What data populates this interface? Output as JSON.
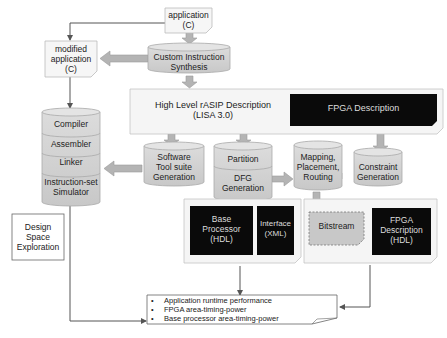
{
  "diagram": {
    "application": [
      "application",
      "(C)"
    ],
    "modified_application": [
      "modified",
      "application",
      "(C)"
    ],
    "custom_instruction_synthesis": [
      "Custom Instruction",
      "Synthesis"
    ],
    "rasip_description": [
      "High Level rASIP Description",
      "(LISA 3.0)"
    ],
    "fpga_description_top": "FPGA Description",
    "tool_stack": [
      "Compiler",
      "Assembler",
      "Linker",
      "Instruction-set",
      "Simulator"
    ],
    "software_toolsuite": [
      "Software",
      "Tool suite",
      "Generation"
    ],
    "partition": "Partition",
    "dfg_generation": [
      "DFG",
      "Generation"
    ],
    "mapping": [
      "Mapping,",
      "Placement,",
      "Routing"
    ],
    "constraint_generation": [
      "Constraint",
      "Generation"
    ],
    "base_processor": [
      "Base",
      "Processor",
      "(HDL)"
    ],
    "interface": [
      "Interface",
      "(XML)"
    ],
    "bitstream": "Bitstream",
    "fpga_description_hdl": [
      "FPGA",
      "Description",
      "(HDL)"
    ],
    "design_space_exploration": [
      "Design",
      "Space",
      "Exploration"
    ],
    "results": [
      "Application runtime performance",
      "FPGA area-timing-power",
      "Base processor area-timing-power"
    ],
    "bullet": "•"
  }
}
